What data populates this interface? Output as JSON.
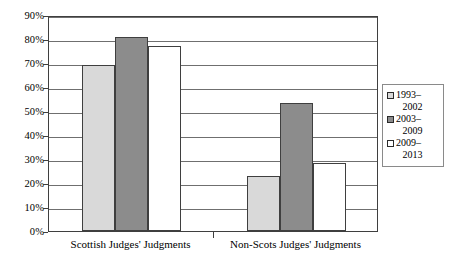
{
  "chart_data": {
    "type": "bar",
    "title": "",
    "xlabel": "",
    "ylabel": "",
    "categories": [
      "Scottish Judges' Judgments",
      "Non-Scots Judges' Judgments"
    ],
    "series": [
      {
        "name": "1993–2002",
        "values": [
          69,
          23
        ],
        "color": "#d9d9d9"
      },
      {
        "name": "2003–2009",
        "values": [
          81,
          53.5
        ],
        "color": "#8c8c8c"
      },
      {
        "name": "2009–2013",
        "values": [
          77,
          28.5
        ],
        "color": "#ffffff"
      }
    ],
    "ylim": [
      0,
      90
    ],
    "yticks": [
      0,
      10,
      20,
      30,
      40,
      50,
      60,
      70,
      80,
      90
    ],
    "ytick_labels": [
      "0%",
      "10%",
      "20%",
      "30%",
      "40%",
      "50%",
      "60%",
      "70%",
      "80%",
      "90%"
    ],
    "grid": true,
    "grid_axis": "y",
    "legend_position": "right"
  },
  "legend": {
    "entries": [
      {
        "line1": "1993–",
        "line2": "2002",
        "swatch": "#d9d9d9"
      },
      {
        "line1": "2003–",
        "line2": "2009",
        "swatch": "#8c8c8c"
      },
      {
        "line1": "2009–",
        "line2": "2013",
        "swatch": "#ffffff"
      }
    ]
  },
  "colors": {
    "series_1": "#d9d9d9",
    "series_2": "#8c8c8c",
    "series_3": "#ffffff",
    "bar_border": "#3f3f3f",
    "gridline": "#6f6f6f",
    "frame": "#3f3f3f",
    "legend_border": "#8a8a8a",
    "background": "#ffffff",
    "text": "#000000"
  }
}
